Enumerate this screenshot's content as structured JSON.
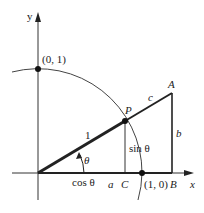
{
  "diagram": {
    "axes": {
      "x_label": "x",
      "y_label": "y"
    },
    "points": {
      "unit_y": "(0, 1)",
      "unit_x": "(1, 0)",
      "P": "P",
      "A": "A",
      "B": "B",
      "C": "C"
    },
    "segment_labels": {
      "radius": "1",
      "hypotenuse_ext": "c",
      "vertical_AB": "b",
      "base_CB": "a",
      "cos": "cos θ",
      "sin": "sin θ",
      "angle": "θ"
    },
    "colors": {
      "stroke": "#222222",
      "background": "#ffffff"
    }
  }
}
